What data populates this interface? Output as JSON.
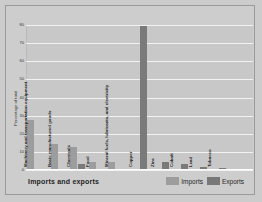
{
  "chart_data": {
    "type": "bar",
    "title": "Imports and exports",
    "xlabel": "",
    "ylabel": "Percentage of total",
    "ylim": [
      0,
      80
    ],
    "yticks": [
      0,
      10,
      20,
      30,
      40,
      50,
      60,
      70,
      80
    ],
    "grid": true,
    "legend_position": "bottom-right",
    "categories": [
      "Machinery and transportation equipment",
      "Basic manufactured goods",
      "Chemicals",
      "Food",
      "Mineral fuels, lubricants, and electricity",
      "Copper",
      "Zinc",
      "Cobalt",
      "Lead",
      "Tobacco"
    ],
    "series": [
      {
        "name": "Imports",
        "color": "#9d9d9d",
        "values": [
          27,
          14,
          12,
          4,
          4,
          0,
          0,
          0,
          0,
          0
        ]
      },
      {
        "name": "Exports",
        "color": "#787878",
        "values": [
          0,
          0,
          3,
          0,
          0,
          79,
          4,
          3,
          1.2,
          0.8
        ]
      }
    ]
  },
  "legend": {
    "imports_label": "Imports",
    "exports_label": "Exports"
  }
}
